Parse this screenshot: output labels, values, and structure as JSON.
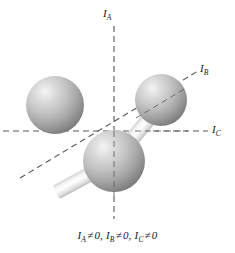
{
  "figure": {
    "type": "molecular-geometry-diagram",
    "background_color": "#ffffff",
    "caption": "I_A ≠ 0, I_B ≠ 0, I_C ≠ 0",
    "caption_parts": {
      "term_a_symbol": "I",
      "term_a_sub": "A",
      "relation": "≠",
      "term_a_value": "0,",
      "term_b_symbol": "I",
      "term_b_sub": "B",
      "term_b_value": "0,",
      "term_c_symbol": "I",
      "term_c_sub": "C",
      "term_c_value": "0"
    },
    "axes": [
      {
        "name": "I_A",
        "symbol": "I",
        "subscript": "A",
        "orientation": "vertical",
        "style": "dashed",
        "color": "#55565a",
        "x1": 114,
        "y1": 26,
        "x2": 114,
        "y2": 219,
        "label_x": 103,
        "label_y": 8
      },
      {
        "name": "I_B",
        "symbol": "I",
        "subscript": "B",
        "orientation": "diagonal",
        "style": "dashed",
        "color": "#55565a",
        "x1": 20,
        "y1": 178,
        "x2": 198,
        "y2": 71,
        "label_x": 200,
        "label_y": 63
      },
      {
        "name": "I_C",
        "symbol": "I",
        "subscript": "C",
        "orientation": "horizontal",
        "style": "dashed",
        "color": "#55565a",
        "x1": 3,
        "y1": 131,
        "x2": 208,
        "y2": 131,
        "label_x": 212,
        "label_y": 124
      }
    ],
    "atoms": [
      {
        "id": "atom-left",
        "cx": 55,
        "cy": 105,
        "r": 29,
        "color_light": "#f0f0f0",
        "color_mid": "#b9b9b9",
        "color_dark": "#767676"
      },
      {
        "id": "atom-right",
        "cx": 161,
        "cy": 100,
        "r": 26,
        "color_light": "#f0f0f0",
        "color_mid": "#b9b9b9",
        "color_dark": "#767676"
      },
      {
        "id": "atom-center",
        "cx": 114,
        "cy": 161,
        "r": 31,
        "color_light": "#f0f0f0",
        "color_mid": "#b9b9b9",
        "color_dark": "#767676"
      }
    ],
    "bonds": [
      {
        "id": "bond-left",
        "from": "atom-center",
        "to": "atom-left",
        "width": 15,
        "color_light": "#ffffff",
        "color_edge": "#c8c8c8"
      },
      {
        "id": "bond-right",
        "from": "atom-center",
        "to": "atom-right",
        "width": 15,
        "color_light": "#ffffff",
        "color_edge": "#c8c8c8"
      }
    ],
    "origin": {
      "x": 114,
      "y": 131
    }
  }
}
